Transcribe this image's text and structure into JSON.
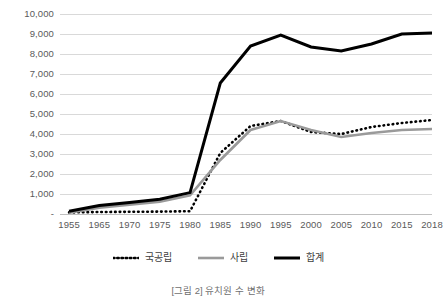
{
  "chart_data": {
    "type": "line",
    "title": "",
    "xlabel": "",
    "ylabel": "",
    "x": [
      1955,
      1965,
      1970,
      1975,
      1980,
      1985,
      1990,
      1995,
      2000,
      2005,
      2010,
      2015,
      2018
    ],
    "xtick_labels": [
      "1955",
      "1965",
      "1970",
      "1975",
      "1980",
      "1985",
      "1990",
      "1995",
      "2000",
      "2005",
      "2010",
      "2015",
      "2018"
    ],
    "ytick_labels": [
      "-",
      "1,000",
      "2,000",
      "3,000",
      "4,000",
      "5,000",
      "6,000",
      "7,000",
      "8,000",
      "9,000",
      "10,000"
    ],
    "ytick_values": [
      0,
      1000,
      2000,
      3000,
      4000,
      5000,
      6000,
      7000,
      8000,
      9000,
      10000
    ],
    "ylim": [
      0,
      10000
    ],
    "grid": true,
    "legend_position": "bottom",
    "series": [
      {
        "name": "국공립",
        "style": "dotted",
        "color": "#000000",
        "values": [
          80,
          100,
          110,
          120,
          140,
          3050,
          4400,
          4650,
          4100,
          4000,
          4350,
          4550,
          4700
        ]
      },
      {
        "name": "사립",
        "style": "solid",
        "color": "#9a9a9a",
        "values": [
          60,
          320,
          470,
          620,
          930,
          2700,
          4200,
          4650,
          4200,
          3850,
          4050,
          4200,
          4250
        ]
      },
      {
        "name": "합계",
        "style": "solid-bold",
        "color": "#000000",
        "values": [
          140,
          420,
          580,
          740,
          1070,
          6550,
          8400,
          8950,
          8350,
          8150,
          8500,
          9000,
          9050
        ]
      }
    ]
  },
  "legend": {
    "items": [
      {
        "label": "국공립",
        "icon": "dotted-line-icon"
      },
      {
        "label": "사립",
        "icon": "gray-line-icon"
      },
      {
        "label": "합계",
        "icon": "black-line-icon"
      }
    ]
  },
  "caption": {
    "text": "[그림 2] 유치원 수 변화"
  },
  "colors": {
    "gridline": "#d9d9d9",
    "baseline": "#bfbfbf",
    "tick_text": "#5a5a5a",
    "private": "#9a9a9a",
    "public": "#000000",
    "total": "#000000"
  }
}
